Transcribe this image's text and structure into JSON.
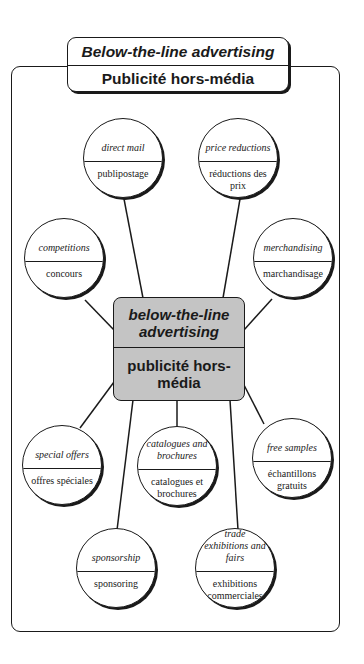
{
  "header": {
    "title_en": "Below-the-line advertising",
    "title_fr": "Publicité hors-média"
  },
  "centre": {
    "label_en": "below-the-line advertising",
    "label_fr": "publicité hors-média",
    "fill_color": "#c4c4c4"
  },
  "nodes": [
    {
      "id": "direct-mail",
      "en": "direct mail",
      "fr": "publipostage"
    },
    {
      "id": "price-reductions",
      "en": "price reductions",
      "fr": "réductions des prix"
    },
    {
      "id": "competitions",
      "en": "competitions",
      "fr": "concours"
    },
    {
      "id": "merchandising",
      "en": "merchandising",
      "fr": "marchandisage"
    },
    {
      "id": "special-offers",
      "en": "special offers",
      "fr": "offres spéciales"
    },
    {
      "id": "catalogues-and-brochures",
      "en": "catalogues and brochures",
      "fr": "catalogues et brochures"
    },
    {
      "id": "free-samples",
      "en": "free samples",
      "fr": "échantillons gratuits"
    },
    {
      "id": "sponsorship",
      "en": "sponsorship",
      "fr": "sponsoring"
    },
    {
      "id": "trade-exhibitions-and-fairs",
      "en": "trade exhibitions and fairs",
      "fr": "exhibitions commerciales"
    }
  ]
}
